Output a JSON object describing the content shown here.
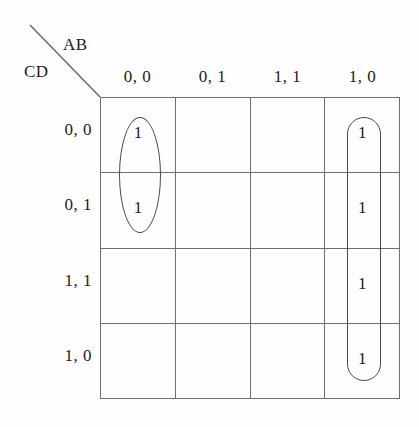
{
  "diagram": {
    "type": "karnaugh-map",
    "column_axis_label": "AB",
    "row_axis_label": "CD",
    "column_headers": [
      "0, 0",
      "0, 1",
      "1, 1",
      "1, 0"
    ],
    "row_headers": [
      "0, 0",
      "0, 1",
      "1, 1",
      "1, 0"
    ],
    "cells": [
      [
        "1",
        "",
        "",
        "1"
      ],
      [
        "1",
        "",
        "",
        "1"
      ],
      [
        "",
        "",
        "",
        "1"
      ],
      [
        "",
        "",
        "",
        "1"
      ]
    ],
    "groups": [
      {
        "name": "left-column-pair",
        "shape": "ellipse",
        "column": "0, 0",
        "rows": [
          "0, 0",
          "0, 1"
        ],
        "cell_count": 2
      },
      {
        "name": "right-column-quad",
        "shape": "stadium",
        "column": "1, 0",
        "rows": [
          "0, 0",
          "0, 1",
          "1, 1",
          "1, 0"
        ],
        "cell_count": 4
      }
    ],
    "colors": {
      "grid_line": "#6e6e6e",
      "group_outline": "#4a4a4a",
      "text": "#1b1b1b",
      "background": "#fefefe"
    }
  }
}
